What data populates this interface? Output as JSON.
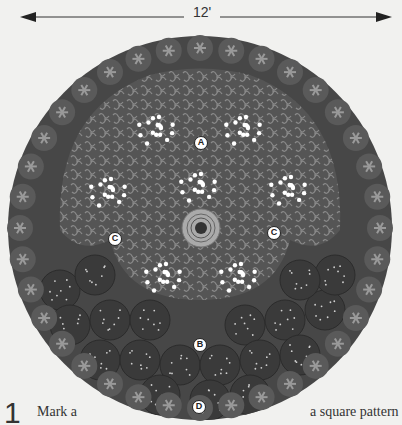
{
  "dimension": {
    "label": "12'"
  },
  "markers": {
    "a": "A",
    "b": "B",
    "c_left": "C",
    "c_right": "C",
    "d": "D"
  },
  "zones": {
    "A": "Inner bed with white-flowered clumps",
    "B": "Outer band of mounded shrubs",
    "C": "Dark transition planting",
    "D": "Border edging of star-shaped flowers"
  },
  "colors": {
    "background": "#f1f1ef",
    "outer_border": "#4a4a4a",
    "inner_bed": "#5c5c5c",
    "mounds": "#3e3e3e",
    "flowers": "#ffffff",
    "center_feature": "#a8a8a8"
  },
  "step": {
    "number": "1",
    "text_left": "Mark a",
    "text_right": "a square pattern"
  }
}
